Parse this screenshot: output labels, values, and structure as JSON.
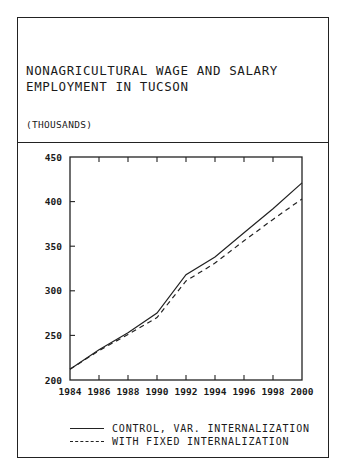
{
  "header": {
    "title_line1": "NONAGRICULTURAL WAGE AND SALARY",
    "title_line2": "EMPLOYMENT IN TUCSON",
    "units": "(THOUSANDS)"
  },
  "legend": {
    "items": [
      {
        "label": "CONTROL, VAR. INTERNALIZATION",
        "style": "solid"
      },
      {
        "label": "WITH FIXED INTERNALIZATION",
        "style": "dashed"
      }
    ]
  },
  "chart_data": {
    "type": "line",
    "subtitle": "(THOUSANDS)",
    "xlabel": "",
    "ylabel": "",
    "x": [
      1984,
      1986,
      1988,
      1990,
      1992,
      1994,
      1996,
      1998,
      2000
    ],
    "x_tick_labels": [
      "1984",
      "1986",
      "1988",
      "1990",
      "1992",
      "1994",
      "1996",
      "1998",
      "2000"
    ],
    "y_tick_labels": [
      "200",
      "250",
      "300",
      "350",
      "400",
      "450"
    ],
    "xlim": [
      1984,
      2000
    ],
    "ylim": [
      200,
      450
    ],
    "grid": false,
    "legend_position": "below",
    "series": [
      {
        "name": "CONTROL, VAR. INTERNALIZATION",
        "line": "solid",
        "values": [
          212,
          234,
          253,
          275,
          318,
          338,
          365,
          392,
          421
        ]
      },
      {
        "name": "WITH FIXED INTERNALIZATION",
        "line": "dashed",
        "values": [
          212,
          233,
          251,
          270,
          311,
          331,
          356,
          380,
          403
        ]
      }
    ]
  }
}
